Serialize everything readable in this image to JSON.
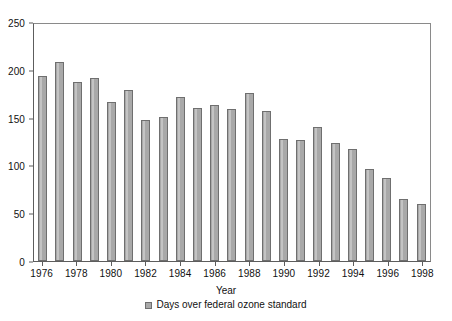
{
  "chart_data": {
    "type": "bar",
    "title": "",
    "xlabel": "Year",
    "ylabel": "",
    "ylim": [
      0,
      250
    ],
    "yticks": [
      0,
      50,
      100,
      150,
      200,
      250
    ],
    "grid": false,
    "legend_position": "bottom",
    "legend": [
      "Days over federal ozone standard"
    ],
    "series_name": "Days over federal ozone standard",
    "categories": [
      "1976",
      "1977",
      "1978",
      "1979",
      "1980",
      "1981",
      "1982",
      "1983",
      "1984",
      "1985",
      "1986",
      "1987",
      "1988",
      "1989",
      "1990",
      "1991",
      "1992",
      "1993",
      "1994",
      "1995",
      "1996",
      "1997",
      "1998"
    ],
    "values": [
      194,
      208,
      187,
      191,
      166,
      179,
      148,
      151,
      172,
      160,
      163,
      159,
      176,
      157,
      128,
      127,
      140,
      123,
      117,
      96,
      87,
      65,
      60
    ],
    "xtick_labels": [
      "1976",
      "1978",
      "1980",
      "1982",
      "1984",
      "1986",
      "1988",
      "1990",
      "1992",
      "1994",
      "1996",
      "1998"
    ]
  },
  "colors": {
    "bar_fill": "#a9a9a9",
    "bar_border": "#6f6f6f",
    "axis": "#5d5d5d",
    "background": "#ffffff",
    "text": "#111111"
  }
}
